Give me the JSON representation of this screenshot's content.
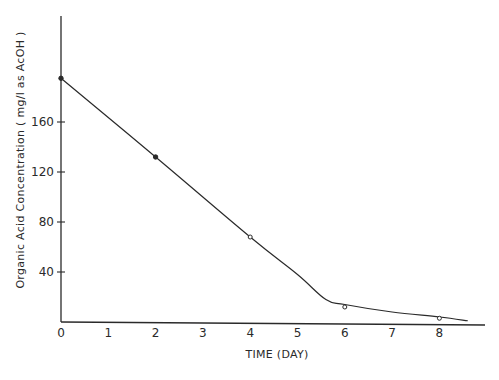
{
  "chart_data": {
    "type": "line",
    "title": "",
    "xlabel": "TIME (DAY)",
    "ylabel": "Organic Acid Concentration ( mg/l as AcOH )",
    "x_ticks": [
      0,
      1,
      2,
      3,
      4,
      5,
      6,
      7,
      8
    ],
    "y_ticks": [
      40,
      80,
      120,
      160
    ],
    "xlim": [
      0,
      9
    ],
    "ylim": [
      0,
      245
    ],
    "grid": false,
    "legend": null,
    "series": [
      {
        "name": "Organic acid",
        "x": [
          0,
          2,
          4,
          6,
          8
        ],
        "values": [
          195,
          132,
          68,
          12,
          3
        ],
        "markers": [
          "filled",
          "filled",
          "open",
          "open",
          "open"
        ]
      }
    ],
    "fitted_curve": {
      "x": [
        0,
        2,
        4,
        5,
        5.6,
        6,
        7,
        8,
        8.6
      ],
      "y": [
        195,
        132,
        68,
        38,
        18,
        14,
        8,
        4,
        1
      ]
    }
  }
}
